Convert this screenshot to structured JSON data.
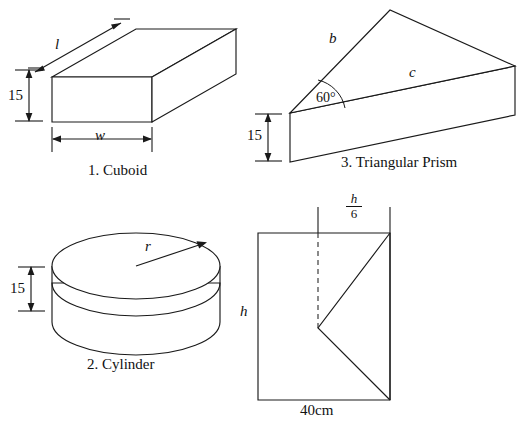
{
  "page": {
    "width": 532,
    "height": 422,
    "background": "#ffffff",
    "ink_color": "#1a1a1a"
  },
  "figures": [
    {
      "id": "cuboid",
      "caption": "1. Cuboid",
      "shape": "cuboid",
      "labels": {
        "length": "l",
        "width": "w",
        "height": "15"
      }
    },
    {
      "id": "cylinder",
      "caption": "2. Cylinder",
      "shape": "cylinder",
      "labels": {
        "radius": "r",
        "height": "15"
      }
    },
    {
      "id": "triangular-prism",
      "caption": "3. Triangular Prism",
      "shape": "triangular-prism",
      "labels": {
        "side_b": "b",
        "side_c": "c",
        "angle": "60°",
        "height": "15"
      }
    },
    {
      "id": "notched-rectangle",
      "caption": "",
      "shape": "rectangle-with-v-notch",
      "labels": {
        "height": "h",
        "fraction_numerator": "h",
        "fraction_denominator": "6",
        "base": "40cm"
      }
    }
  ]
}
